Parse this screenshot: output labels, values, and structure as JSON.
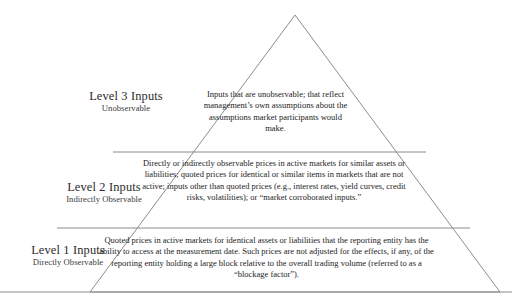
{
  "diagram": {
    "shape": "triangle",
    "colors": {
      "outline": "#8c8c8c",
      "divider": "#8c8c8c",
      "baseline": "#8c8c8c",
      "text": "#232323",
      "background": "#ffffff"
    },
    "geometry": {
      "apex": [
        295,
        15
      ],
      "bottom_left": [
        90,
        292
      ],
      "bottom_right": [
        500,
        292
      ],
      "baseline_y": 292,
      "baseline_x_start": 0,
      "baseline_x_end": 512,
      "divider_upper": {
        "y": 152,
        "x_start": 113,
        "x_end": 426
      },
      "divider_lower": {
        "y": 228,
        "x_start": 57,
        "x_end": 470
      }
    },
    "levels": [
      {
        "id": "level-3",
        "title": "Level 3 Inputs",
        "subtitle": "Unobservable",
        "body": "Inputs that are unobservable; that reflect management’s own assumptions about the assumptions market participants would make."
      },
      {
        "id": "level-2",
        "title": "Level 2 Inputs",
        "subtitle": "Indirectly Observable",
        "body": "Directly or indirectly observable prices in active markets for similar assets or liabilities; quoted prices for identical or similar items in markets that are not active; inputs other than quoted prices (e.g., interest rates, yield curves, credit risks, volatilities); or “market corroborated inputs.”"
      },
      {
        "id": "level-1",
        "title": "Level 1 Inputs",
        "subtitle": "Directly Observable",
        "body": "Quoted prices in active markets for identical assets or liabilities that the reporting entity has the ability to access at the measurement date. Such prices are not adjusted for the effects, if any, of the reporting entity holding a large block relative to the overall trading volume (referred to as a “blockage factor”)."
      }
    ]
  }
}
